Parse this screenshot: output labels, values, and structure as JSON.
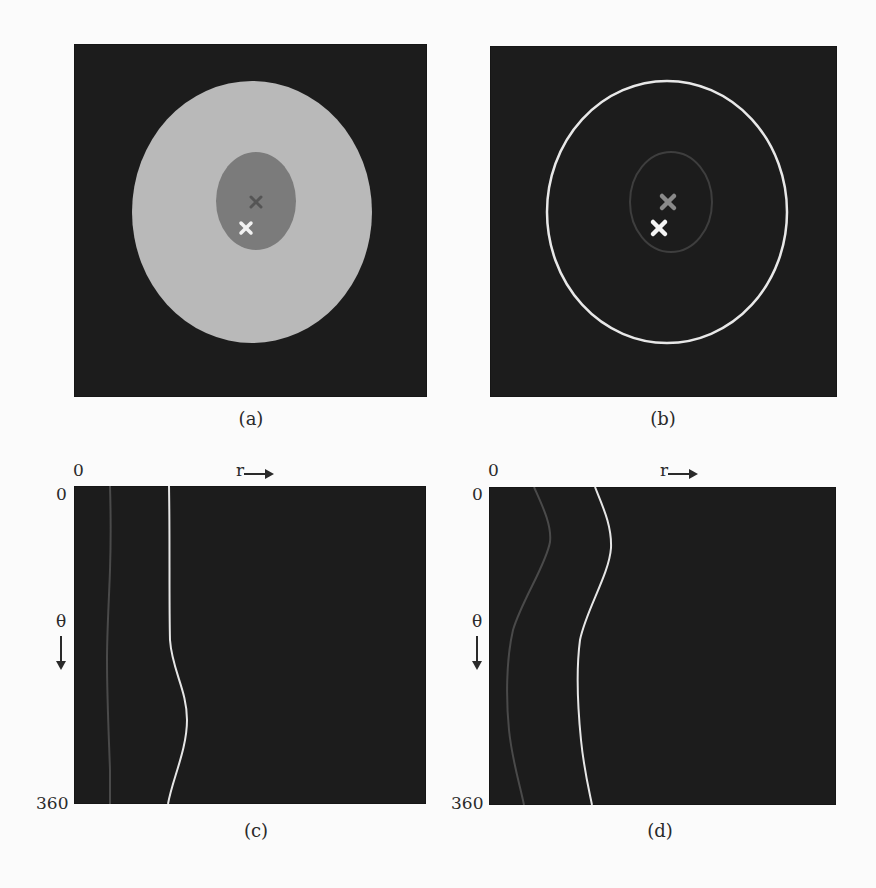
{
  "figure": {
    "panels": [
      {
        "id": "a",
        "caption": "(a)",
        "type": "cartesian-image",
        "background": "#1c1c1c",
        "outer_region": {
          "cx": 252,
          "cy": 212,
          "rx": 120,
          "ry": 131,
          "fill": "#b9b9b9"
        },
        "inner_region": {
          "cx": 256,
          "cy": 201,
          "rx": 40,
          "ry": 49,
          "fill": "#7b7b7b"
        },
        "markers": [
          {
            "name": "dark-cross",
            "x": 256,
            "y": 202,
            "color": "#555555",
            "size": 5
          },
          {
            "name": "white-cross",
            "x": 246,
            "y": 228,
            "color": "#f2f2f2",
            "size": 5
          }
        ]
      },
      {
        "id": "b",
        "caption": "(b)",
        "type": "cartesian-boundary",
        "background": "#1c1c1c",
        "outer_boundary": {
          "cx": 667,
          "cy": 212,
          "rx": 120,
          "ry": 131,
          "stroke": "#e8e8e8",
          "width": 2.5
        },
        "inner_boundary": {
          "cx": 671,
          "cy": 202,
          "rx": 41,
          "ry": 50,
          "stroke": "#3e3e3e",
          "width": 2
        },
        "markers": [
          {
            "name": "gray-cross",
            "x": 668,
            "y": 202,
            "color": "#8a8a8a",
            "size": 7
          },
          {
            "name": "white-cross",
            "x": 659,
            "y": 228,
            "color": "#f4f4f4",
            "size": 7
          }
        ]
      },
      {
        "id": "c",
        "caption": "(c)",
        "type": "polar-unwrapped",
        "axis_labels": {
          "r_origin": "0",
          "theta_origin": "0",
          "theta_end": "360",
          "r_label": "r",
          "theta_label": "θ"
        },
        "curves": [
          {
            "name": "inner-boundary",
            "stroke": "#4a4a4a",
            "width": 2,
            "points": [
              [
                110,
                486
              ],
              [
                111,
                540
              ],
              [
                109,
                600
              ],
              [
                107,
                650
              ],
              [
                108,
                700
              ],
              [
                110,
                760
              ],
              [
                110,
                804
              ]
            ]
          },
          {
            "name": "outer-boundary",
            "stroke": "#e6e6e6",
            "width": 2,
            "points": [
              [
                169,
                486
              ],
              [
                170,
                540
              ],
              [
                169,
                610
              ],
              [
                170,
                650
              ],
              [
                183,
                690
              ],
              [
                187,
                720
              ],
              [
                181,
                760
              ],
              [
                171,
                790
              ],
              [
                168,
                804
              ]
            ]
          }
        ]
      },
      {
        "id": "d",
        "caption": "(d)",
        "type": "polar-unwrapped",
        "axis_labels": {
          "r_origin": "0",
          "theta_origin": "0",
          "theta_end": "360",
          "r_label": "r",
          "theta_label": "θ"
        },
        "curves": [
          {
            "name": "inner-boundary",
            "stroke": "#4a4a4a",
            "width": 2,
            "points": [
              [
                534,
                487
              ],
              [
                550,
                540
              ],
              [
                540,
                580
              ],
              [
                512,
                640
              ],
              [
                508,
                700
              ],
              [
                515,
                770
              ],
              [
                524,
                805
              ]
            ]
          },
          {
            "name": "outer-boundary",
            "stroke": "#e6e6e6",
            "width": 2,
            "points": [
              [
                595,
                487
              ],
              [
                611,
                545
              ],
              [
                597,
                610
              ],
              [
                580,
                650
              ],
              [
                579,
                700
              ],
              [
                585,
                770
              ],
              [
                592,
                805
              ]
            ]
          }
        ]
      }
    ]
  },
  "bleed_through_text": [
    "Surrounding page text faintly visible through the paper"
  ]
}
